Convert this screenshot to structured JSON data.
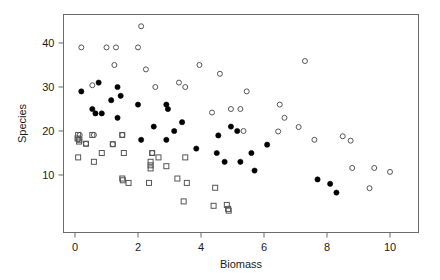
{
  "chart_data": {
    "type": "scatter",
    "title": "",
    "xlabel": "Biomass",
    "ylabel": "Species",
    "xlim": [
      -0.45,
      10.6
    ],
    "ylim": [
      0.5,
      44.8
    ],
    "xticks": [
      0,
      2,
      4,
      6,
      8,
      10
    ],
    "xtick_labels": [
      "0",
      "2",
      "4",
      "6",
      "8",
      "10"
    ],
    "yticks": [
      10,
      20,
      30,
      40
    ],
    "ytick_labels": [
      "10",
      "20",
      "30",
      "40"
    ],
    "grid": false,
    "legend": "none",
    "frame": "box",
    "series": [
      {
        "name": "open-circle",
        "marker": "open-circle",
        "color": "#555555",
        "points": [
          [
            2.1,
            43.8
          ],
          [
            0.2,
            39.0
          ],
          [
            1.0,
            39.0
          ],
          [
            1.3,
            39.0
          ],
          [
            2.0,
            39.0
          ],
          [
            1.25,
            35.0
          ],
          [
            3.95,
            35.0
          ],
          [
            7.3,
            35.9
          ],
          [
            2.25,
            34.0
          ],
          [
            4.6,
            33.0
          ],
          [
            0.55,
            30.4
          ],
          [
            2.55,
            30.0
          ],
          [
            3.3,
            31.0
          ],
          [
            3.5,
            30.0
          ],
          [
            5.45,
            29.0
          ],
          [
            6.5,
            26.0
          ],
          [
            4.95,
            25.0
          ],
          [
            5.25,
            25.0
          ],
          [
            4.35,
            24.2
          ],
          [
            6.65,
            23.0
          ],
          [
            7.1,
            20.9
          ],
          [
            5.35,
            20.0
          ],
          [
            6.45,
            19.9
          ],
          [
            0.15,
            19.1
          ],
          [
            0.6,
            19.1
          ],
          [
            1.5,
            19.1
          ],
          [
            8.5,
            18.8
          ],
          [
            0.1,
            18.1
          ],
          [
            7.6,
            18.0
          ],
          [
            8.75,
            17.8
          ],
          [
            0.35,
            17.1
          ],
          [
            1.2,
            17.0
          ],
          [
            2.45,
            15.0
          ],
          [
            8.8,
            11.6
          ],
          [
            9.5,
            11.6
          ],
          [
            10.0,
            10.7
          ],
          [
            9.35,
            7.0
          ]
        ]
      },
      {
        "name": "filled-circle",
        "marker": "filled-circle",
        "color": "#000000",
        "points": [
          [
            0.75,
            31.0
          ],
          [
            1.35,
            30.0
          ],
          [
            0.2,
            29.0
          ],
          [
            1.45,
            28.0
          ],
          [
            1.15,
            27.0
          ],
          [
            2.0,
            26.0
          ],
          [
            2.9,
            26.0
          ],
          [
            2.95,
            25.0
          ],
          [
            0.55,
            25.0
          ],
          [
            0.65,
            24.0
          ],
          [
            0.85,
            24.0
          ],
          [
            1.35,
            23.0
          ],
          [
            3.4,
            22.0
          ],
          [
            4.95,
            21.0
          ],
          [
            2.5,
            21.0
          ],
          [
            3.15,
            20.0
          ],
          [
            5.15,
            20.0
          ],
          [
            4.55,
            19.0
          ],
          [
            2.1,
            18.0
          ],
          [
            2.9,
            18.0
          ],
          [
            6.1,
            16.9
          ],
          [
            3.85,
            16.0
          ],
          [
            4.5,
            15.0
          ],
          [
            5.6,
            15.0
          ],
          [
            4.75,
            13.0
          ],
          [
            5.25,
            13.0
          ],
          [
            5.7,
            11.0
          ],
          [
            7.7,
            9.0
          ],
          [
            8.1,
            8.0
          ],
          [
            8.3,
            6.0
          ]
        ]
      },
      {
        "name": "open-square",
        "marker": "open-square",
        "color": "#555555",
        "points": [
          [
            0.1,
            19.1
          ],
          [
            0.08,
            18.3
          ],
          [
            0.14,
            18.0
          ],
          [
            0.13,
            17.6
          ],
          [
            0.55,
            19.1
          ],
          [
            1.5,
            19.1
          ],
          [
            0.35,
            17.1
          ],
          [
            1.2,
            17.0
          ],
          [
            0.1,
            14.0
          ],
          [
            0.85,
            15.0
          ],
          [
            1.55,
            15.0
          ],
          [
            0.6,
            13.0
          ],
          [
            2.45,
            15.0
          ],
          [
            2.65,
            14.0
          ],
          [
            2.4,
            13.0
          ],
          [
            2.4,
            12.2
          ],
          [
            2.4,
            11.5
          ],
          [
            2.9,
            12.0
          ],
          [
            3.5,
            14.0
          ],
          [
            1.5,
            9.2
          ],
          [
            1.52,
            8.8
          ],
          [
            1.7,
            8.2
          ],
          [
            2.35,
            8.2
          ],
          [
            3.25,
            9.2
          ],
          [
            3.55,
            8.2
          ],
          [
            4.45,
            7.1
          ],
          [
            3.45,
            4.0
          ],
          [
            4.4,
            3.0
          ],
          [
            4.82,
            3.2
          ],
          [
            4.86,
            2.3
          ],
          [
            4.88,
            1.9
          ]
        ]
      }
    ]
  },
  "axis": {
    "x_title": "Biomass",
    "y_title": "Species"
  }
}
